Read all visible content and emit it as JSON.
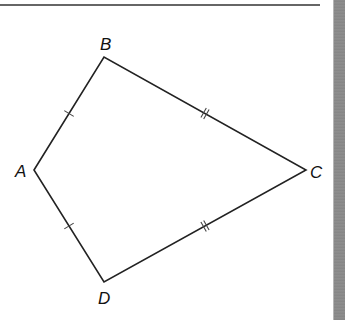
{
  "figure": {
    "type": "quadrilateral-kite",
    "stroke_color": "#222222",
    "background": "#ffffff",
    "edge_strip_color": "#8a8a8a",
    "top_rule": {
      "x1": 0,
      "y1": 5,
      "x2": 320,
      "y2": 5
    },
    "vertices": {
      "A": {
        "label": "A",
        "x": 34,
        "y": 170,
        "label_x": 15,
        "label_y": 177
      },
      "B": {
        "label": "B",
        "x": 104,
        "y": 57,
        "label_x": 100,
        "label_y": 50
      },
      "C": {
        "label": "C",
        "x": 306,
        "y": 170,
        "label_x": 310,
        "label_y": 178
      },
      "D": {
        "label": "D",
        "x": 104,
        "y": 282,
        "label_x": 98,
        "label_y": 304
      }
    },
    "sides": [
      {
        "name": "AB",
        "from": "A",
        "to": "B",
        "tick_marks": 1
      },
      {
        "name": "BC",
        "from": "B",
        "to": "C",
        "tick_marks": 2
      },
      {
        "name": "CD",
        "from": "C",
        "to": "D",
        "tick_marks": 2
      },
      {
        "name": "DA",
        "from": "D",
        "to": "A",
        "tick_marks": 1
      }
    ],
    "congruence": [
      "AB ≅ AD",
      "BC ≅ CD"
    ]
  }
}
